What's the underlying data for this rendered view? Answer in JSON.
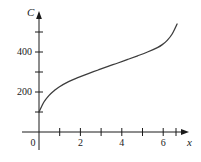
{
  "chart_data": {
    "type": "line",
    "title": "",
    "xlabel": "x",
    "ylabel": "C",
    "xlim": [
      0,
      7.3
    ],
    "ylim": [
      0,
      600
    ],
    "grid": false,
    "legend": null,
    "x_ticks": [
      0,
      1,
      2,
      3,
      4,
      5,
      6,
      7
    ],
    "x_tick_labels": [
      "0",
      "",
      "2",
      "",
      "4",
      "",
      "6",
      ""
    ],
    "y_ticks": [
      100,
      200,
      300,
      400,
      500
    ],
    "y_tick_labels": [
      "",
      "200",
      "",
      "400",
      ""
    ],
    "series": [
      {
        "name": "C",
        "x": [
          0,
          0.25,
          0.5,
          0.75,
          1,
          1.5,
          2,
          2.5,
          3,
          3.5,
          4,
          4.5,
          5,
          5.5,
          6,
          6.25,
          6.5,
          6.75,
          7
        ],
        "values": [
          100,
          150,
          182,
          205,
          224,
          252,
          273,
          292,
          310,
          328,
          345,
          363,
          381,
          400,
          422,
          437,
          458,
          490,
          540
        ]
      }
    ],
    "curve_color": "#3d3d3d",
    "axis_color": "#1a1a1a"
  },
  "labels": {
    "y_axis_title": "C",
    "x_axis_title": "x",
    "y_200": "200",
    "y_400": "400",
    "x_0": "0",
    "x_2": "2",
    "x_4": "4",
    "x_6": "6"
  }
}
